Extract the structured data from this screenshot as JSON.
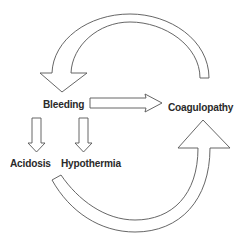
{
  "diagram": {
    "type": "cycle-flow",
    "nodes": {
      "bleeding": "Bleeding",
      "coagulopathy": "Coagulopathy",
      "acidosis": "Acidosis",
      "hypothermia": "Hypothermia"
    },
    "edges": [
      {
        "from": "Bleeding",
        "to": "Coagulopathy",
        "style": "block-arrow"
      },
      {
        "from": "Bleeding",
        "to": "Acidosis",
        "style": "block-arrow"
      },
      {
        "from": "Bleeding",
        "to": "Hypothermia",
        "style": "block-arrow"
      },
      {
        "from": "Coagulopathy",
        "to": "Bleeding",
        "style": "curved-block-arrow"
      },
      {
        "from": "Acidosis / Hypothermia",
        "to": "Coagulopathy",
        "style": "curved-block-arrow"
      }
    ],
    "colors": {
      "stroke": "#555555",
      "fill": "#ffffff",
      "text": "#2a2a2a"
    }
  }
}
